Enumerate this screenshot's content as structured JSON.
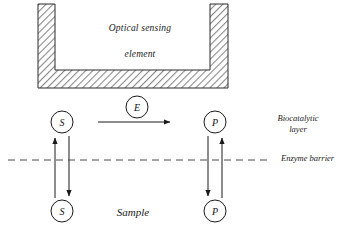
{
  "figure": {
    "background_color": "#ffffff",
    "ink_color": "#1a1a1a",
    "hatch_color": "#8c8c8c"
  },
  "sensor": {
    "label_line1": "Optical sensing",
    "label_line2": "element",
    "label_x": 140,
    "label_y": 22
  },
  "layers": {
    "biocatalytic_line1": "Biocatalytic",
    "biocatalytic_line2": "layer",
    "biocatalytic_x": 298,
    "biocatalytic_y": 113,
    "enzyme_barrier": "Enzyme barrier",
    "enzyme_barrier_x": 281,
    "enzyme_barrier_y": 153,
    "sample": "Sample",
    "sample_x": 133,
    "sample_y": 211
  },
  "nodes": [
    {
      "id": "substrate-top",
      "letter": "S",
      "x": 62,
      "y": 122,
      "r": 11
    },
    {
      "id": "enzyme",
      "letter": "E",
      "x": 137,
      "y": 107,
      "r": 11
    },
    {
      "id": "product-top",
      "letter": "P",
      "x": 215,
      "y": 122,
      "r": 11
    },
    {
      "id": "substrate-bottom",
      "letter": "S",
      "x": 62,
      "y": 211,
      "r": 11
    },
    {
      "id": "product-bottom",
      "letter": "P",
      "x": 215,
      "y": 211,
      "r": 11
    }
  ],
  "arrows": {
    "reaction": {
      "label": "E",
      "from_x": 98,
      "to_x": 172,
      "y": 122,
      "direction": "right"
    },
    "substrate_up": {
      "x": 55,
      "from_y": 198,
      "to_y": 136,
      "direction": "up"
    },
    "substrate_down": {
      "x": 69,
      "from_y": 136,
      "to_y": 198,
      "direction": "down"
    },
    "product_up": {
      "x": 222,
      "from_y": 198,
      "to_y": 136,
      "direction": "up"
    },
    "product_down": {
      "x": 208,
      "from_y": 136,
      "to_y": 198,
      "direction": "down"
    }
  },
  "barrier_line": {
    "x1": 8,
    "x2": 272,
    "y": 160,
    "style": "dashed"
  }
}
